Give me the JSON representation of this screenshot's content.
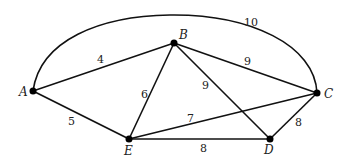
{
  "graph": {
    "title": "Weighted graph",
    "nodes": [
      {
        "id": "A",
        "label": "A",
        "x": 33,
        "y": 91
      },
      {
        "id": "B",
        "label": "B",
        "x": 174,
        "y": 43
      },
      {
        "id": "C",
        "label": "C",
        "x": 317,
        "y": 93
      },
      {
        "id": "D",
        "label": "D",
        "x": 270,
        "y": 139
      },
      {
        "id": "E",
        "label": "E",
        "x": 129,
        "y": 139
      }
    ],
    "edges": [
      {
        "from": "A",
        "to": "B",
        "weight": "4"
      },
      {
        "from": "A",
        "to": "E",
        "weight": "5"
      },
      {
        "from": "A",
        "to": "C",
        "weight": "10",
        "curved": true
      },
      {
        "from": "B",
        "to": "E",
        "weight": "6"
      },
      {
        "from": "B",
        "to": "C",
        "weight": "9"
      },
      {
        "from": "B",
        "to": "D",
        "weight": "9"
      },
      {
        "from": "E",
        "to": "C",
        "weight": "7"
      },
      {
        "from": "E",
        "to": "D",
        "weight": "8"
      },
      {
        "from": "C",
        "to": "D",
        "weight": "8"
      }
    ]
  },
  "labels": {
    "A": "A",
    "B": "B",
    "C": "C",
    "D": "D",
    "E": "E",
    "w_AB": "4",
    "w_AE": "5",
    "w_AC": "10",
    "w_BE": "6",
    "w_BC": "9",
    "w_BD": "9",
    "w_EC": "7",
    "w_ED": "8",
    "w_CD": "8"
  }
}
